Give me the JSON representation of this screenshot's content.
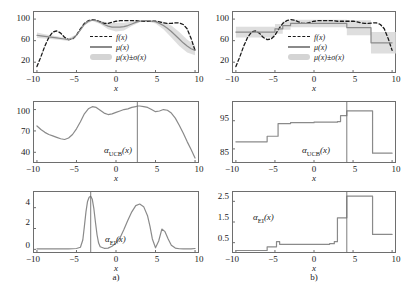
{
  "figure": {
    "sublabel_a": "a)",
    "sublabel_b": "b)"
  },
  "legend": {
    "f_label": "f(x)",
    "mu_label": "μ(x)",
    "band_label": "μ(x)±σ(x)",
    "keys": [
      "dashed-black-line",
      "solid-gray-line",
      "gray-shaded-band"
    ]
  },
  "labels": {
    "x_axis": "x",
    "ucb": "α",
    "ucb_sub": "UCB",
    "ucb_arg": "(x)",
    "ei": "α",
    "ei_sub": "EI",
    "ei_arg": "(x)"
  },
  "colors": {
    "line_true": "#1a1a1a",
    "line_mean": "#8a8a8a",
    "band": "#d8d8d8",
    "frame": "#6e6e6e",
    "marker_line": "#6e6e6e"
  },
  "chart_data": [
    {
      "id": "panel-a-surrogate",
      "type": "line",
      "title": "",
      "xlabel": "x",
      "ylabel": "",
      "xlim": [
        -10.5,
        10.5
      ],
      "ylim": [
        0,
        115
      ],
      "xticks": [
        -10,
        -5,
        0,
        5,
        10
      ],
      "xticklabels": [
        "−10",
        "−5",
        "0",
        "5",
        "10"
      ],
      "yticks": [
        20,
        60,
        100
      ],
      "yticklabels": [
        "20",
        "60",
        "100"
      ],
      "grid": false,
      "legend_position": "inside-center",
      "series": [
        {
          "name": "f(x)",
          "style": "dashed",
          "color": "#1a1a1a",
          "x": [
            -10,
            -9.5,
            -9,
            -8.5,
            -8,
            -7.5,
            -7,
            -6.5,
            -6,
            -5.5,
            -5,
            -4.5,
            -4,
            -3.5,
            -3,
            -2.5,
            -2,
            -1.5,
            -1,
            -0.5,
            0,
            0.5,
            1,
            1.5,
            2,
            2.5,
            3,
            3.5,
            4,
            4.5,
            5,
            5.5,
            6,
            6.5,
            7,
            7.5,
            8,
            8.5,
            9,
            9.5,
            10
          ],
          "y": [
            12,
            30,
            50,
            66,
            76,
            78,
            74,
            66,
            62,
            63,
            70,
            82,
            92,
            97,
            99,
            98,
            95,
            92,
            92,
            94,
            96,
            97,
            97,
            97,
            97,
            97,
            96,
            96,
            96,
            96,
            96,
            95,
            93,
            92,
            92,
            93,
            93,
            90,
            82,
            64,
            42
          ]
        },
        {
          "name": "μ(x)",
          "style": "solid",
          "color": "#8a8a8a",
          "x": [
            -10,
            -9.5,
            -9,
            -8.5,
            -8,
            -7.5,
            -7,
            -6.5,
            -6,
            -5.5,
            -5,
            -4.5,
            -4,
            -3.5,
            -3,
            -2.5,
            -2,
            -1.5,
            -1,
            -0.5,
            0,
            0.5,
            1,
            1.5,
            2,
            2.5,
            3,
            3.5,
            4,
            4.5,
            5,
            5.5,
            6,
            6.5,
            7,
            7.5,
            8,
            8.5,
            9,
            9.5,
            10
          ],
          "y": [
            70,
            69,
            68,
            67,
            66,
            65,
            64,
            63,
            62,
            64,
            70,
            80,
            90,
            96,
            98,
            97,
            94,
            90,
            87,
            85,
            85,
            85,
            86,
            88,
            91,
            94,
            96,
            97,
            97,
            96,
            95,
            92,
            88,
            83,
            77,
            70,
            63,
            56,
            50,
            45,
            42
          ]
        },
        {
          "name": "μ(x)±σ(x)",
          "style": "band",
          "color": "#d8d8d8",
          "x": [
            -10,
            -9,
            -8,
            -7,
            -6,
            -5,
            -4,
            -3,
            -2,
            -1,
            0,
            1,
            2,
            3,
            4,
            5,
            6,
            7,
            8,
            9,
            10
          ],
          "sigma": [
            5,
            4,
            3.5,
            3,
            2.5,
            2,
            1.5,
            1.5,
            3,
            6,
            8,
            7,
            4,
            2,
            1.5,
            3,
            7,
            11,
            13,
            12,
            9
          ]
        }
      ]
    },
    {
      "id": "panel-a-ucb",
      "type": "line",
      "title": "",
      "xlabel": "x",
      "ylabel": "α_UCB(x)",
      "xlim": [
        -10.5,
        10.5
      ],
      "ylim": [
        25,
        112
      ],
      "xticks": [
        -10,
        -5,
        0,
        5,
        10
      ],
      "xticklabels": [
        "−10",
        "−5",
        "0",
        "5",
        "10"
      ],
      "yticks": [
        40,
        70,
        100
      ],
      "yticklabels": [
        "40",
        "70",
        "100"
      ],
      "grid": false,
      "marker_x": 2.7,
      "series": [
        {
          "name": "α_UCB(x)",
          "style": "solid",
          "color": "#8a8a8a",
          "x": [
            -10,
            -9.5,
            -9,
            -8.5,
            -8,
            -7.5,
            -7,
            -6.5,
            -6,
            -5.5,
            -5,
            -4.5,
            -4,
            -3.5,
            -3,
            -2.5,
            -2,
            -1.5,
            -1,
            -0.5,
            0,
            0.5,
            1,
            1.5,
            2,
            2.5,
            2.7,
            3,
            3.5,
            4,
            4.5,
            5,
            5.5,
            6,
            6.5,
            7,
            7.5,
            8,
            8.5,
            9,
            9.5,
            10
          ],
          "y": [
            77,
            72,
            68,
            65,
            63,
            61,
            59,
            58,
            60,
            65,
            73,
            83,
            94,
            101,
            104,
            103,
            99,
            95,
            93,
            94,
            96,
            98,
            100,
            101,
            103,
            104,
            105,
            105,
            104,
            103,
            100,
            97,
            98,
            100,
            99,
            95,
            88,
            78,
            67,
            55,
            44,
            32
          ]
        }
      ]
    },
    {
      "id": "panel-a-ei",
      "type": "line",
      "title": "",
      "xlabel": "x",
      "ylabel": "α_EI(x)",
      "xlim": [
        -10.5,
        10.5
      ],
      "ylim": [
        -0.35,
        5.6
      ],
      "xticks": [
        -10,
        -5,
        0,
        5,
        10
      ],
      "xticklabels": [
        "−10",
        "−5",
        "0",
        "5",
        "10"
      ],
      "yticks": [
        0,
        2,
        4
      ],
      "yticklabels": [
        "0",
        "2",
        "4"
      ],
      "grid": false,
      "marker_x": -3.2,
      "series": [
        {
          "name": "α_EI(x)",
          "style": "solid",
          "color": "#8a8a8a",
          "x": [
            -10,
            -9,
            -8,
            -7,
            -6,
            -5,
            -4.5,
            -4.2,
            -4,
            -3.8,
            -3.6,
            -3.4,
            -3.2,
            -3.0,
            -2.8,
            -2.6,
            -2.4,
            -2.2,
            -2,
            -1.5,
            -1,
            -0.5,
            0,
            0.5,
            1,
            1.5,
            2,
            2.5,
            3,
            3.5,
            4,
            4.3,
            4.6,
            5,
            5.4,
            5.8,
            6.2,
            6.6,
            7,
            7.5,
            8,
            8.5,
            9,
            9.5,
            10
          ],
          "y": [
            0.05,
            0.05,
            0.05,
            0.05,
            0.05,
            0.08,
            0.2,
            0.9,
            2.2,
            3.6,
            4.6,
            5.0,
            5.1,
            4.8,
            3.9,
            2.6,
            1.4,
            0.6,
            0.25,
            0.1,
            0.12,
            0.3,
            0.6,
            1.1,
            1.9,
            2.8,
            3.6,
            4.2,
            4.35,
            4.1,
            3.2,
            2.2,
            1.0,
            0.15,
            0.8,
            1.95,
            1.7,
            1.0,
            0.4,
            0.12,
            0.06,
            0.05,
            0.05,
            0.05,
            0.08
          ]
        }
      ]
    },
    {
      "id": "panel-b-surrogate",
      "type": "line",
      "title": "",
      "xlabel": "x",
      "ylabel": "",
      "xlim": [
        -10.5,
        10.5
      ],
      "ylim": [
        0,
        115
      ],
      "xticks": [
        -10,
        -5,
        0,
        5,
        10
      ],
      "xticklabels": [
        "−10",
        "−5",
        "0",
        "5",
        "10"
      ],
      "yticks": [
        20,
        60,
        100
      ],
      "yticklabels": [
        "20",
        "60",
        "100"
      ],
      "grid": false,
      "legend_position": "inside-center",
      "series": [
        {
          "name": "f(x)",
          "style": "dashed",
          "color": "#1a1a1a",
          "x": [
            -10,
            -9.5,
            -9,
            -8.5,
            -8,
            -7.5,
            -7,
            -6.5,
            -6,
            -5.5,
            -5,
            -4.5,
            -4,
            -3.5,
            -3,
            -2.5,
            -2,
            -1.5,
            -1,
            -0.5,
            0,
            0.5,
            1,
            1.5,
            2,
            2.5,
            3,
            3.5,
            4,
            4.5,
            5,
            5.5,
            6,
            6.5,
            7,
            7.5,
            8,
            8.5,
            9,
            9.5,
            10
          ],
          "y": [
            12,
            30,
            50,
            66,
            76,
            78,
            74,
            66,
            62,
            63,
            70,
            82,
            92,
            97,
            99,
            98,
            95,
            92,
            92,
            94,
            96,
            97,
            97,
            97,
            97,
            97,
            96,
            96,
            96,
            96,
            96,
            95,
            93,
            92,
            92,
            93,
            93,
            90,
            82,
            64,
            42
          ]
        },
        {
          "name": "μ(x)",
          "style": "step",
          "color": "#8a8a8a",
          "x": [
            -10,
            -6.5,
            -5,
            -4,
            -3,
            0.5,
            4.2,
            7.3,
            10
          ],
          "y": [
            76,
            76,
            82,
            88,
            92,
            92,
            84,
            56,
            56
          ]
        },
        {
          "name": "μ(x)±σ(x)",
          "style": "band-step",
          "color": "#d8d8d8",
          "x": [
            -10,
            -6.5,
            -5,
            -4,
            -3,
            0.5,
            4.2,
            7.3,
            10
          ],
          "sigma": [
            10,
            10,
            9,
            8,
            7,
            7,
            14,
            20,
            20
          ]
        }
      ]
    },
    {
      "id": "panel-b-ucb",
      "type": "line",
      "title": "",
      "xlabel": "x",
      "ylabel": "α_UCB(x)",
      "xlim": [
        -10.5,
        10.5
      ],
      "ylim": [
        80,
        102
      ],
      "xticks": [
        -10,
        -5,
        0,
        5,
        10
      ],
      "xticklabels": [
        "−10",
        "−5",
        "0",
        "5",
        "10"
      ],
      "yticks": [
        85,
        95
      ],
      "yticklabels": [
        "85",
        "95"
      ],
      "grid": false,
      "marker_x": 4.2,
      "series": [
        {
          "name": "α_UCB(x)",
          "style": "step",
          "color": "#8a8a8a",
          "x": [
            -10,
            -6.4,
            -6.0,
            -5.0,
            -4.6,
            -3.0,
            0.0,
            3.0,
            3.4,
            4.2,
            7.2,
            7.5,
            10
          ],
          "y": [
            87.5,
            87.5,
            89.5,
            89.5,
            94,
            94.3,
            94.5,
            94.7,
            96.8,
            98.5,
            98.5,
            83.5,
            83.5
          ]
        }
      ]
    },
    {
      "id": "panel-b-ei",
      "type": "line",
      "title": "",
      "xlabel": "x",
      "ylabel": "α_EI(x)",
      "xlim": [
        -10.5,
        10.5
      ],
      "ylim": [
        0,
        3.0
      ],
      "xticks": [
        -10,
        -5,
        0,
        5,
        10
      ],
      "xticklabels": [
        "−10",
        "−5",
        "0",
        "5",
        "10"
      ],
      "yticks": [
        0.5,
        1.5,
        2.5
      ],
      "yticklabels": [
        "0.5",
        "1.5",
        "2.5"
      ],
      "grid": false,
      "marker_x": 4.2,
      "series": [
        {
          "name": "α_EI(x)",
          "style": "step",
          "color": "#8a8a8a",
          "x": [
            -10,
            -6.4,
            -6.0,
            -5.2,
            -4.8,
            -4.4,
            -2.0,
            2.0,
            2.6,
            3.0,
            4.2,
            7.2,
            7.5,
            10
          ],
          "y": [
            0.12,
            0.12,
            0.3,
            0.3,
            0.55,
            0.42,
            0.42,
            0.45,
            0.55,
            1.7,
            2.75,
            2.75,
            0.9,
            0.9
          ]
        }
      ]
    }
  ]
}
